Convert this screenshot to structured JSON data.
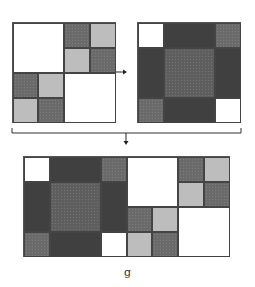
{
  "figure": {
    "caption_label": "g",
    "colors": {
      "white": "#ffffff",
      "light_gray": "#bdbdbd",
      "medium_dotted": "#6a6a6a",
      "dark": "#404040",
      "center_dotted": "#5e5e5e",
      "line": "#333333"
    },
    "panels": [
      {
        "name": "matrix-A",
        "description": "2x2 block matrix: top-left white, top-right 2x2 checker (dark/light), bottom-left 2x2 checker (dark/light), bottom-right white"
      },
      {
        "name": "matrix-B",
        "description": "3x3 block matrix: white corner, dark bands, dotted center, dotted corners"
      },
      {
        "name": "combined-matrix",
        "description": "Concatenation of matrix-B and matrix-A variant"
      }
    ],
    "arrows": [
      {
        "from": "matrix-A",
        "to": "matrix-B",
        "direction": "right"
      },
      {
        "from": "bracket",
        "to": "combined-matrix",
        "direction": "down"
      }
    ]
  }
}
